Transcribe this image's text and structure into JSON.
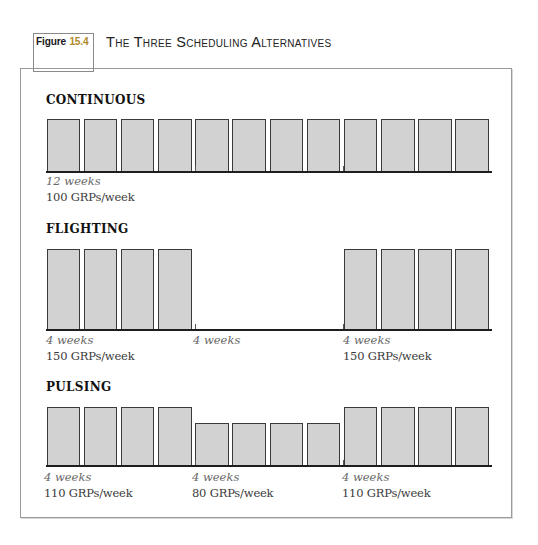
{
  "figure": {
    "label_word": "Figure",
    "label_number": "15.4",
    "title": "The Three Scheduling Alternatives",
    "accent_color": "#b08a2a"
  },
  "sections": [
    {
      "heading": "CONTINUOUS",
      "groups": [
        {
          "weeks_label": "12 weeks",
          "grps_label": "100 GRPs/week"
        }
      ]
    },
    {
      "heading": "FLIGHTING",
      "groups": [
        {
          "weeks_label": "4 weeks",
          "grps_label": "150 GRPs/week"
        },
        {
          "weeks_label": "4 weeks",
          "grps_label": ""
        },
        {
          "weeks_label": "4 weeks",
          "grps_label": "150 GRPs/week"
        }
      ]
    },
    {
      "heading": "PULSING",
      "groups": [
        {
          "weeks_label": "4 weeks",
          "grps_label": "110 GRPs/week"
        },
        {
          "weeks_label": "4 weeks",
          "grps_label": "80 GRPs/week"
        },
        {
          "weeks_label": "4 weeks",
          "grps_label": "110 GRPs/week"
        }
      ]
    }
  ],
  "chart_data": [
    {
      "type": "bar",
      "title": "CONTINUOUS",
      "xlabel": "Week",
      "ylabel": "GRPs/week",
      "categories": [
        "1",
        "2",
        "3",
        "4",
        "5",
        "6",
        "7",
        "8",
        "9",
        "10",
        "11",
        "12"
      ],
      "values": [
        100,
        100,
        100,
        100,
        100,
        100,
        100,
        100,
        100,
        100,
        100,
        100
      ],
      "annotations": [
        "12 weeks",
        "100 GRPs/week"
      ],
      "grid": false
    },
    {
      "type": "bar",
      "title": "FLIGHTING",
      "xlabel": "Week",
      "ylabel": "GRPs/week",
      "categories": [
        "1",
        "2",
        "3",
        "4",
        "5",
        "6",
        "7",
        "8",
        "9",
        "10",
        "11",
        "12"
      ],
      "values": [
        150,
        150,
        150,
        150,
        0,
        0,
        0,
        0,
        150,
        150,
        150,
        150
      ],
      "annotations": [
        "4 weeks",
        "150 GRPs/week",
        "4 weeks",
        "4 weeks",
        "150 GRPs/week"
      ],
      "grid": false
    },
    {
      "type": "bar",
      "title": "PULSING",
      "xlabel": "Week",
      "ylabel": "GRPs/week",
      "categories": [
        "1",
        "2",
        "3",
        "4",
        "5",
        "6",
        "7",
        "8",
        "9",
        "10",
        "11",
        "12"
      ],
      "values": [
        110,
        110,
        110,
        110,
        80,
        80,
        80,
        80,
        110,
        110,
        110,
        110
      ],
      "annotations": [
        "4 weeks",
        "110 GRPs/week",
        "4 weeks",
        "80 GRPs/week",
        "4 weeks",
        "110 GRPs/week"
      ],
      "grid": false
    }
  ]
}
